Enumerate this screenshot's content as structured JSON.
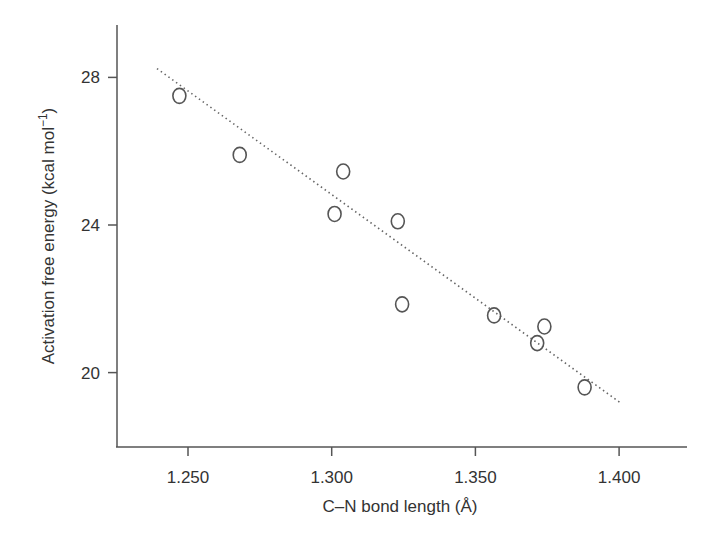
{
  "chart_data": {
    "type": "scatter",
    "title": "",
    "xlabel": "C–N bond length (Å)",
    "ylabel": "Activation free energy (kcal mol⁻¹)",
    "xlim": [
      1.2262,
      1.4243
    ],
    "ylim": [
      17.9,
      29.4
    ],
    "x_ticks": [
      1.25,
      1.3,
      1.35,
      1.4
    ],
    "x_tick_labels": [
      "1.250",
      "1.300",
      "1.350",
      "1.400"
    ],
    "y_ticks": [
      20,
      24,
      28
    ],
    "y_tick_labels": [
      "20",
      "24",
      "28"
    ],
    "grid": false,
    "legend": null,
    "series": [
      {
        "name": "data",
        "marker": "open-circle",
        "x": [
          1.247,
          1.268,
          1.304,
          1.301,
          1.323,
          1.3245,
          1.3565,
          1.374,
          1.3715,
          1.388
        ],
        "y": [
          27.5,
          25.9,
          25.45,
          24.3,
          24.1,
          21.85,
          21.55,
          21.25,
          20.8,
          19.6
        ]
      }
    ],
    "trendline": {
      "style": "dotted",
      "x": [
        1.2392,
        1.4003
      ],
      "y": [
        28.24,
        19.19
      ]
    }
  },
  "axes": {
    "x_title": "C–N bond length (Å)",
    "y_title": "Activation free energy (kcal mol⁻¹)"
  }
}
